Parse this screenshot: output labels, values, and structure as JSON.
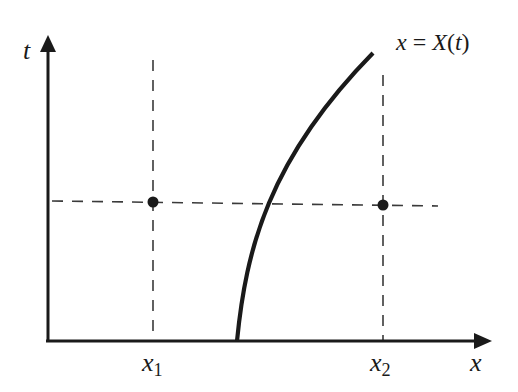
{
  "diagram": {
    "type": "spacetime-trajectory",
    "colors": {
      "ink": "#1a1a1a",
      "dash": "#3a3a3a",
      "background": "#ffffff"
    },
    "axes": {
      "vertical": {
        "label": "t"
      },
      "horizontal": {
        "label": "x"
      }
    },
    "curve": {
      "label_lhs": "x",
      "label_eq": "=",
      "label_rhs_fn": "X",
      "label_rhs_arg": "(t)",
      "label_full": "x = X(t)"
    },
    "markers": [
      {
        "name": "x1",
        "base": "x",
        "sub": "1"
      },
      {
        "name": "x2",
        "base": "x",
        "sub": "2"
      }
    ],
    "points": [
      {
        "at": "x1",
        "description": "dot at (x1, t)"
      },
      {
        "at": "x2",
        "description": "dot at (x2, t)"
      }
    ],
    "guides": {
      "horizontal_dashed": "constant t line",
      "vertical_dashed": [
        "x1 line",
        "x2 line"
      ]
    }
  }
}
